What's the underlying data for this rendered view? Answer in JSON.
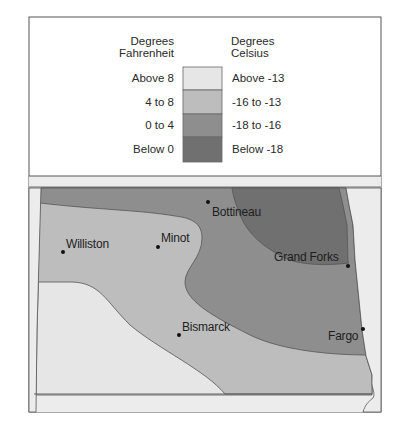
{
  "legend": {
    "fahrenheit_title_line1": "Degrees",
    "fahrenheit_title_line2": "Fahrenheit",
    "celsius_title_line1": "Degrees",
    "celsius_title_line2": "Celsius",
    "bins": [
      {
        "fahrenheit": "Above 8",
        "celsius": "Above -13",
        "color": "#e6e6e6"
      },
      {
        "fahrenheit": "4 to 8",
        "celsius": "-16 to -13",
        "color": "#bdbdbd"
      },
      {
        "fahrenheit": "0 to 4",
        "celsius": "-18 to -16",
        "color": "#8e8e8e"
      },
      {
        "fahrenheit": "Below 0",
        "celsius": "Below -18",
        "color": "#707070"
      }
    ]
  },
  "map": {
    "region": "North Dakota",
    "background_color": "#ececec",
    "cities": [
      {
        "name": "Bottineau"
      },
      {
        "name": "Williston"
      },
      {
        "name": "Minot"
      },
      {
        "name": "Grand Forks"
      },
      {
        "name": "Bismarck"
      },
      {
        "name": "Fargo"
      }
    ]
  }
}
